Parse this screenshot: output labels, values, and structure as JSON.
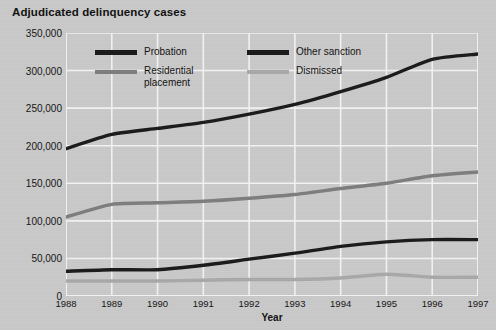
{
  "chart_data": {
    "type": "line",
    "title": "Adjudicated delinquency cases",
    "xlabel": "Year",
    "ylabel": "",
    "x": [
      1988,
      1989,
      1990,
      1991,
      1992,
      1993,
      1994,
      1995,
      1996,
      1997
    ],
    "xtick_labels": [
      "1988",
      "1989",
      "1990",
      "1991",
      "1992",
      "1993",
      "1994",
      "1995",
      "1996",
      "1997"
    ],
    "ytick_labels": [
      "0",
      "50,000",
      "100,000",
      "150,000",
      "200,000",
      "250,000",
      "300,000",
      "350,000"
    ],
    "yticks": [
      0,
      50000,
      100000,
      150000,
      200000,
      250000,
      300000,
      350000
    ],
    "ylim": [
      0,
      350000
    ],
    "xlim": [
      1988,
      1997
    ],
    "grid": true,
    "legend_position": "upper-left-inside",
    "series": [
      {
        "name": "Probation",
        "color": "#1a1a1a",
        "width": 3.4,
        "values": [
          196000,
          215000,
          223000,
          231000,
          242000,
          255000,
          272000,
          291000,
          315000,
          322000
        ]
      },
      {
        "name": "Other sanction",
        "color": "#1a1a1a",
        "width": 3.4,
        "values": [
          33000,
          35000,
          35000,
          41000,
          49000,
          57000,
          66000,
          72000,
          75000,
          75000
        ]
      },
      {
        "name": "Residential placement",
        "color": "#7d7d7d",
        "width": 3.4,
        "values": [
          105000,
          122000,
          124000,
          126000,
          130000,
          135000,
          143000,
          150000,
          160000,
          165000
        ]
      },
      {
        "name": "Dismissed",
        "color": "#a8a8a8",
        "width": 3.4,
        "values": [
          20000,
          20000,
          20000,
          21000,
          22000,
          22000,
          24000,
          29000,
          25000,
          25000
        ]
      }
    ]
  },
  "legend": {
    "entries": [
      {
        "label": "Probation",
        "color": "#1a1a1a"
      },
      {
        "label": "Other sanction",
        "color": "#1a1a1a"
      },
      {
        "label": "Residential\nplacement",
        "color": "#7d7d7d"
      },
      {
        "label": "Dismissed",
        "color": "#a8a8a8"
      }
    ]
  },
  "style": {
    "background": "#c9c9c9",
    "gridline_color": "#f2f2f2",
    "text_color": "#111111"
  }
}
